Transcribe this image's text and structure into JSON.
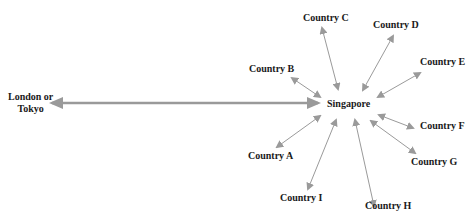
{
  "diagram": {
    "hub": {
      "label": "Singapore"
    },
    "origin": {
      "label_line1": "London or",
      "label_line2": "Tokyo"
    },
    "countries": [
      {
        "label": "Country A"
      },
      {
        "label": "Country B"
      },
      {
        "label": "Country C"
      },
      {
        "label": "Country D"
      },
      {
        "label": "Country E"
      },
      {
        "label": "Country F"
      },
      {
        "label": "Country G"
      },
      {
        "label": "Country H"
      },
      {
        "label": "Country I"
      }
    ],
    "arrow_color": "#9a9a9a"
  }
}
